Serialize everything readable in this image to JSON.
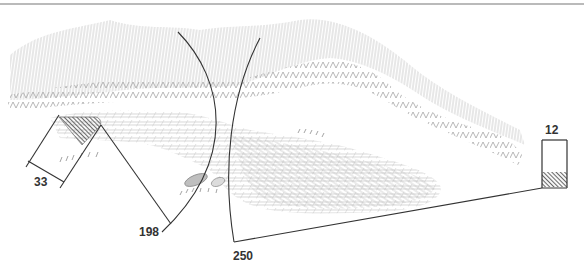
{
  "diagram": {
    "kind": "terrain-sketch-with-dimensions",
    "top_rule": true,
    "colors": {
      "line": "#333333",
      "hatch_light": "#c8c8c8",
      "hatch_mid": "#b0b0b0",
      "hatch_dark": "#6e6e6e",
      "rule": "#777777"
    },
    "dimensions": [
      {
        "id": "width-33",
        "label": "33"
      },
      {
        "id": "radius-198",
        "label": "198"
      },
      {
        "id": "radius-250",
        "label": "250"
      },
      {
        "id": "width-12",
        "label": "12"
      }
    ]
  }
}
